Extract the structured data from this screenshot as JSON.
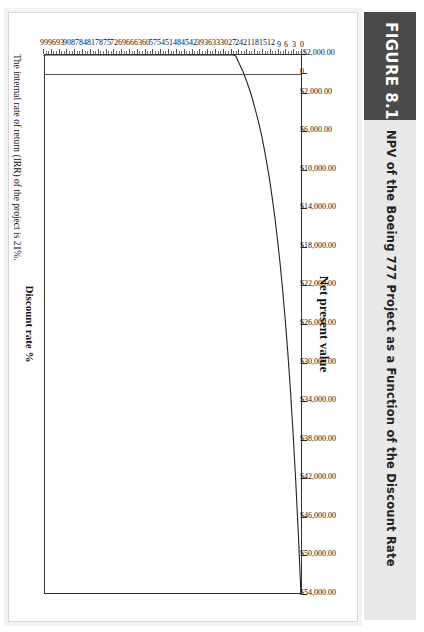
{
  "figure": {
    "tag": "FIGURE 8.1",
    "caption": "NPV of the Boeing 777 Project as a Function of the Discount Rate",
    "tag_bg": "#4a4a4a",
    "caption_bg": "#e8e8e8"
  },
  "note": "The internal rate of return (IRR) of the project is 21%.",
  "chart_data": {
    "type": "line",
    "title": "",
    "xlabel": "Net present value",
    "ylabel": "Discount rate %",
    "orientation": "horizontal-bars-rotated",
    "value_axis": {
      "label": "Net present value",
      "min": -2000,
      "max": 54000,
      "step": 4000,
      "tick_labels": [
        "-$2,000.00",
        "0",
        "$2,000.00",
        "$6,000.00",
        "$10,000.00",
        "$14,000.00",
        "$18,000.00",
        "$22,000.00",
        "$26,000.00",
        "$30,000.00",
        "$34,000.00",
        "$38,000.00",
        "$42,000.00",
        "$46,000.00",
        "$50,000.00",
        "$54,000.00"
      ],
      "tick_values": [
        -2000,
        0,
        2000,
        6000,
        10000,
        14000,
        18000,
        22000,
        26000,
        30000,
        34000,
        38000,
        42000,
        46000,
        50000,
        54000
      ]
    },
    "category_axis": {
      "label": "Discount rate %",
      "min": 0,
      "max": 99,
      "step": 3,
      "tick_labels": [
        "0",
        "3",
        "6",
        "9",
        "12",
        "15",
        "18",
        "21",
        "24",
        "27",
        "30",
        "33",
        "36",
        "39",
        "42",
        "45",
        "48",
        "51",
        "54",
        "57",
        "60",
        "63",
        "66",
        "69",
        "72",
        "75",
        "78",
        "81",
        "84",
        "87",
        "90",
        "93",
        "96",
        "99"
      ]
    },
    "irr_percent": 21,
    "grid": false,
    "legend": false,
    "x": [
      0,
      1,
      2,
      3,
      4,
      5,
      6,
      7,
      8,
      9,
      10,
      11,
      12,
      13,
      14,
      15,
      16,
      17,
      18,
      19,
      20,
      21,
      22,
      23,
      24,
      25,
      26,
      27,
      28,
      30,
      33,
      36,
      39,
      42,
      45,
      48,
      51,
      54,
      57,
      60,
      63,
      66,
      69,
      72,
      75,
      78,
      81,
      84,
      87,
      90,
      93,
      96,
      99
    ],
    "values": [
      54000,
      47800,
      42300,
      37400,
      33000,
      29100,
      25600,
      22500,
      19700,
      17200,
      14900,
      12900,
      11000,
      9400,
      7900,
      6500,
      5300,
      4200,
      3200,
      2200,
      1400,
      600,
      -100,
      -700,
      -1300,
      -1900,
      -2400,
      -2800,
      -3200,
      -3900,
      -4800,
      -5500,
      -6100,
      -6600,
      -7000,
      -7300,
      -7600,
      -7900,
      -8100,
      -8300,
      -8400,
      -8600,
      -8700,
      -8800,
      -8900,
      -9000,
      -9100,
      -9200,
      -9200,
      -9300,
      -9400,
      -9400,
      -9500
    ]
  }
}
